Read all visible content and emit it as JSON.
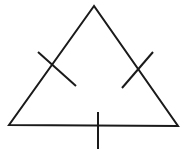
{
  "diagram": {
    "title": "",
    "stroke_color": "#1a1a1a",
    "background": "#ffffff",
    "triangle": {
      "points": "94,6 9,125 178,126"
    },
    "ticks": [
      {
        "side": "left",
        "x1": 38,
        "y1": 52,
        "x2": 76,
        "y2": 86
      },
      {
        "side": "right",
        "x1": 153,
        "y1": 52,
        "x2": 122,
        "y2": 88
      },
      {
        "side": "bottom",
        "x1": 98,
        "y1": 112,
        "x2": 98,
        "y2": 149
      }
    ]
  }
}
